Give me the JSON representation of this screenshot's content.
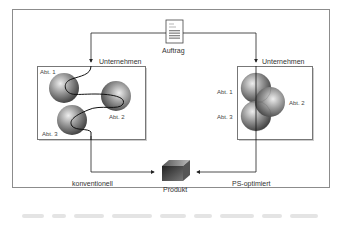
{
  "diagram": {
    "order_label": "Auftrag",
    "left_panel": {
      "company_label": "Unternehmen",
      "departments": [
        "Abt. 1",
        "Abt. 2",
        "Abt. 3"
      ],
      "flow_label": "konventionell"
    },
    "right_panel": {
      "company_label": "Unternehmen",
      "departments": [
        "Abt. 1",
        "Abt. 2",
        "Abt. 3"
      ],
      "flow_label": "PS-optimiert"
    },
    "product_label": "Produkt"
  },
  "colors": {
    "frame": "#8c8c8c",
    "line": "#222222",
    "sphere_dark": "#3a3a3a",
    "sphere_light": "#e8e8e8",
    "caption_gray": "#e4e4e4"
  }
}
